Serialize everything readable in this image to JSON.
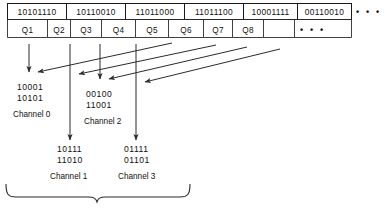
{
  "figure": {
    "stroke_color": "#2b2b2b",
    "text_color": "#111111",
    "background": "#ffffff"
  },
  "byte_row": {
    "cells": [
      {
        "value": "10101110"
      },
      {
        "value": "10110010"
      },
      {
        "value": "11011000"
      },
      {
        "value": "11011100"
      },
      {
        "value": "10001111"
      },
      {
        "value": "00110010"
      }
    ],
    "ellipsis": "• • •"
  },
  "q_row": {
    "cells": [
      {
        "label": "Q1"
      },
      {
        "label": "Q2"
      },
      {
        "label": "Q3"
      },
      {
        "label": "Q4"
      },
      {
        "label": "Q5"
      },
      {
        "label": "Q6"
      },
      {
        "label": "Q7"
      },
      {
        "label": "Q8"
      }
    ],
    "ellipsis": "• • •"
  },
  "channels": [
    {
      "name": "Channel 0",
      "line1": "10001",
      "line2": "10101"
    },
    {
      "name": "Channel 1",
      "line1": "10111",
      "line2": "11010"
    },
    {
      "name": "Channel 2",
      "line1": "00100",
      "line2": "11001"
    },
    {
      "name": "Channel 3",
      "line1": "01111",
      "line2": "01101"
    }
  ]
}
